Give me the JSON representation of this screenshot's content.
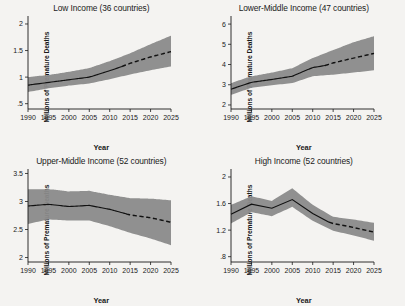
{
  "figure": {
    "background_color": "#f4f3f1",
    "band_color": "#8a8a8a",
    "line_color": "#111111",
    "layout": "2x2 small multiples",
    "xlabel": "Year",
    "ylabel": "Millions of Premature Deaths"
  },
  "chart_data": [
    {
      "type": "line",
      "title": "Low Income (36 countries)",
      "xlabel": "Year",
      "ylabel": "Millions of Premature Deaths",
      "xlim": [
        1990,
        2025
      ],
      "ylim": [
        0.4,
        2.15
      ],
      "xticks": [
        1990,
        1995,
        2000,
        2005,
        2010,
        2015,
        2020,
        2025
      ],
      "yticks": [
        0.5,
        1,
        1.5,
        2
      ],
      "ytick_labels": [
        ".5",
        "1",
        "1.5",
        "2"
      ],
      "grid": false,
      "legend": "none",
      "x": [
        1990,
        1995,
        2000,
        2005,
        2010,
        2015,
        2020,
        2025
      ],
      "series": [
        {
          "name": "Observed (solid)",
          "style": "solid",
          "x": [
            1990,
            1995,
            2000,
            2005,
            2010,
            2013
          ],
          "values": [
            0.85,
            0.9,
            0.95,
            1.0,
            1.12,
            1.2
          ]
        },
        {
          "name": "Projected (dashed)",
          "style": "dashed",
          "x": [
            2013,
            2015,
            2020,
            2025
          ],
          "values": [
            1.2,
            1.26,
            1.38,
            1.48
          ]
        },
        {
          "name": "Uncertainty band upper",
          "style": "band",
          "x": [
            1990,
            1995,
            2000,
            2005,
            2010,
            2015,
            2020,
            2025
          ],
          "values": [
            1.0,
            1.04,
            1.1,
            1.17,
            1.3,
            1.45,
            1.62,
            1.78
          ]
        },
        {
          "name": "Uncertainty band lower",
          "style": "band",
          "x": [
            1990,
            1995,
            2000,
            2005,
            2010,
            2015,
            2020,
            2025
          ],
          "values": [
            0.72,
            0.79,
            0.84,
            0.88,
            0.96,
            1.05,
            1.13,
            1.2
          ]
        }
      ]
    },
    {
      "type": "line",
      "title": "Lower-Middle Income (47 countries)",
      "xlabel": "Year",
      "ylabel": "Millions of Premature Deaths",
      "xlim": [
        1990,
        2025
      ],
      "ylim": [
        1.8,
        6.4
      ],
      "xticks": [
        1990,
        1995,
        2000,
        2005,
        2010,
        2015,
        2020,
        2025
      ],
      "yticks": [
        2,
        3,
        4,
        5,
        6
      ],
      "ytick_labels": [
        "2",
        "3",
        "4",
        "5",
        "6"
      ],
      "grid": false,
      "legend": "none",
      "x": [
        1990,
        1995,
        2000,
        2005,
        2010,
        2015,
        2020,
        2025
      ],
      "series": [
        {
          "name": "Observed (solid)",
          "style": "solid",
          "x": [
            1990,
            1995,
            2000,
            2005,
            2010,
            2013
          ],
          "values": [
            2.78,
            3.12,
            3.26,
            3.42,
            3.85,
            3.95
          ]
        },
        {
          "name": "Projected (dashed)",
          "style": "dashed",
          "x": [
            2013,
            2015,
            2020,
            2025
          ],
          "values": [
            3.95,
            4.08,
            4.32,
            4.55
          ]
        },
        {
          "name": "Uncertainty band upper",
          "style": "band",
          "x": [
            1990,
            1995,
            2000,
            2005,
            2010,
            2015,
            2020,
            2025
          ],
          "values": [
            3.08,
            3.42,
            3.6,
            3.82,
            4.32,
            4.72,
            5.1,
            5.4
          ]
        },
        {
          "name": "Uncertainty band lower",
          "style": "band",
          "x": [
            1990,
            1995,
            2000,
            2005,
            2010,
            2015,
            2020,
            2025
          ],
          "values": [
            2.5,
            2.85,
            2.98,
            3.08,
            3.42,
            3.5,
            3.6,
            3.72
          ]
        }
      ]
    },
    {
      "type": "line",
      "title": "Upper-Middle Income (52 countries)",
      "xlabel": "Year",
      "ylabel": "Millions of Premature Deaths",
      "xlim": [
        1990,
        2025
      ],
      "ylim": [
        1.92,
        3.58
      ],
      "xticks": [
        1990,
        1995,
        2000,
        2005,
        2010,
        2015,
        2020,
        2025
      ],
      "yticks": [
        2,
        2.5,
        3,
        3.5
      ],
      "ytick_labels": [
        "2",
        "2.5",
        "3",
        "3.5"
      ],
      "grid": false,
      "legend": "none",
      "x": [
        1990,
        1995,
        2000,
        2005,
        2010,
        2015,
        2020,
        2025
      ],
      "series": [
        {
          "name": "Observed (solid)",
          "style": "solid",
          "x": [
            1990,
            1995,
            2000,
            2005,
            2010,
            2014
          ],
          "values": [
            2.92,
            2.95,
            2.91,
            2.93,
            2.86,
            2.78
          ]
        },
        {
          "name": "Projected (dashed)",
          "style": "dashed",
          "x": [
            2014,
            2015,
            2020,
            2025
          ],
          "values": [
            2.78,
            2.76,
            2.71,
            2.63
          ]
        },
        {
          "name": "Uncertainty band upper",
          "style": "band",
          "x": [
            1990,
            1995,
            2000,
            2005,
            2010,
            2015,
            2020,
            2025
          ],
          "values": [
            3.22,
            3.22,
            3.18,
            3.19,
            3.12,
            3.06,
            3.05,
            3.02
          ]
        },
        {
          "name": "Uncertainty band lower",
          "style": "band",
          "x": [
            1990,
            1995,
            2000,
            2005,
            2010,
            2015,
            2020,
            2025
          ],
          "values": [
            2.6,
            2.68,
            2.66,
            2.66,
            2.56,
            2.44,
            2.34,
            2.22
          ]
        }
      ]
    },
    {
      "type": "line",
      "title": "High Income (52 countries)",
      "xlabel": "Year",
      "ylabel": "Millions of Premature Deaths",
      "xlim": [
        1990,
        2025
      ],
      "ylim": [
        0.72,
        2.12
      ],
      "xticks": [
        1990,
        1995,
        2000,
        2005,
        2010,
        2015,
        2020,
        2025
      ],
      "yticks": [
        0.8,
        1.2,
        1.6,
        2
      ],
      "ytick_labels": [
        ".8",
        "1.2",
        "1.6",
        "2"
      ],
      "grid": false,
      "legend": "none",
      "x": [
        1990,
        1995,
        2000,
        2005,
        2010,
        2015,
        2020,
        2025
      ],
      "series": [
        {
          "name": "Observed (solid)",
          "style": "solid",
          "x": [
            1990,
            1995,
            2000,
            2005,
            2010,
            2014
          ],
          "values": [
            1.44,
            1.59,
            1.53,
            1.66,
            1.45,
            1.32
          ]
        },
        {
          "name": "Projected (dashed)",
          "style": "dashed",
          "x": [
            2014,
            2015,
            2020,
            2025
          ],
          "values": [
            1.32,
            1.3,
            1.24,
            1.17
          ]
        },
        {
          "name": "Uncertainty band upper",
          "style": "band",
          "x": [
            1990,
            1995,
            2000,
            2005,
            2010,
            2015,
            2020,
            2025
          ],
          "values": [
            1.58,
            1.71,
            1.64,
            1.83,
            1.58,
            1.4,
            1.36,
            1.31
          ]
        },
        {
          "name": "Uncertainty band lower",
          "style": "band",
          "x": [
            1990,
            1995,
            2000,
            2005,
            2010,
            2015,
            2020,
            2025
          ],
          "values": [
            1.3,
            1.47,
            1.41,
            1.55,
            1.34,
            1.19,
            1.12,
            1.04
          ]
        }
      ]
    }
  ]
}
